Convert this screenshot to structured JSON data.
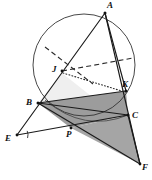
{
  "figure": {
    "canvas": {
      "width": 152,
      "height": 180
    },
    "background_color": "#ffffff",
    "stroke_color": "#1a1a1a",
    "shade_color": "#9a9a9a",
    "shade_color_light": "#b5b5b5",
    "dash_color": "#2a2a2a"
  },
  "circle": {
    "name": "circumcircle",
    "cx": 84,
    "cy": 65,
    "r": 51,
    "stroke": "#333333",
    "stroke_width": 0.9,
    "fill": "none"
  },
  "points": [
    {
      "id": "A",
      "label": "A",
      "x": 105,
      "y": 13,
      "label_x": 107,
      "label_y": 1,
      "marker": true
    },
    {
      "id": "B",
      "label": "B",
      "x": 38,
      "y": 103,
      "label_x": 26,
      "label_y": 98,
      "marker": true
    },
    {
      "id": "C",
      "label": "C",
      "x": 128,
      "y": 115,
      "label_x": 132,
      "label_y": 111,
      "marker": true
    },
    {
      "id": "E",
      "label": "E",
      "x": 17,
      "y": 135,
      "label_x": 5,
      "label_y": 134,
      "marker": true
    },
    {
      "id": "F",
      "label": "F",
      "x": 140,
      "y": 164,
      "label_x": 142,
      "label_y": 163,
      "marker": true
    },
    {
      "id": "J",
      "label": "J",
      "x": 62,
      "y": 71,
      "label_x": 52,
      "label_y": 65,
      "marker": true
    },
    {
      "id": "K",
      "label": "K",
      "x": 126,
      "y": 91,
      "label_x": 122,
      "label_y": 80,
      "marker": true
    },
    {
      "id": "P",
      "label": "P",
      "x": 71,
      "y": 128,
      "label_x": 66,
      "label_y": 130,
      "marker": true
    }
  ],
  "solid_segments": [
    {
      "name": "segment-A-E",
      "x1": 105,
      "y1": 13,
      "x2": 17,
      "y2": 135
    },
    {
      "name": "segment-A-F",
      "x1": 105,
      "y1": 13,
      "x2": 140,
      "y2": 164
    },
    {
      "name": "segment-A-K",
      "x1": 105,
      "y1": 13,
      "x2": 126,
      "y2": 91
    },
    {
      "name": "segment-B-C",
      "x1": 38,
      "y1": 103,
      "x2": 128,
      "y2": 115
    },
    {
      "name": "segment-E-C",
      "x1": 17,
      "y1": 135,
      "x2": 128,
      "y2": 115
    },
    {
      "name": "segment-B-F",
      "x1": 38,
      "y1": 103,
      "x2": 140,
      "y2": 164
    },
    {
      "name": "segment-C-F",
      "x1": 128,
      "y1": 115,
      "x2": 140,
      "y2": 164
    },
    {
      "name": "segment-B-K",
      "x1": 38,
      "y1": 103,
      "x2": 126,
      "y2": 91
    }
  ],
  "dashed_segments": [
    {
      "name": "dashed-upper-left-chord",
      "x1": 45,
      "y1": 47,
      "x2": 93,
      "y2": 84
    },
    {
      "name": "dashed-through-J-right",
      "x1": 62,
      "y1": 71,
      "x2": 133,
      "y2": 58
    }
  ],
  "dotted_segments": [
    {
      "name": "dotted-J-to-K",
      "x1": 63,
      "y1": 73,
      "x2": 125,
      "y2": 92
    }
  ],
  "shaded_regions": [
    {
      "name": "shaded-quad-B-K-C-P",
      "points": "38,103 126,91 128,115 71,128",
      "fill": "#9c9c9c"
    },
    {
      "name": "shaded-triangle-P-C-F",
      "points": "71,128 128,115 140,164",
      "fill": "#a5a5a5"
    },
    {
      "name": "shaded-sliver-J-B-P",
      "points": "62,73 38,103 71,128 96,100",
      "fill": "#efefef"
    }
  ],
  "arc_in_shade": {
    "name": "circle-arc-lower",
    "description": "lower arc of circumcircle crossing the shaded region",
    "d": "M 45 100 Q 84 133 128 115"
  },
  "angle_marks": [
    {
      "name": "angle-mark-at-E",
      "cx": 17,
      "cy": 135,
      "r": 11,
      "start_deg": -22,
      "end_deg": 16
    }
  ]
}
